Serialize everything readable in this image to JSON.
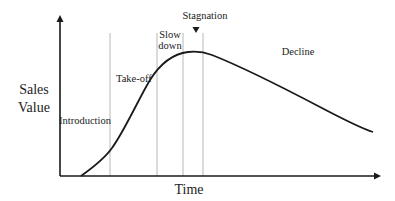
{
  "diagram": {
    "y_axis_label_line1": "Sales",
    "y_axis_label_line2": "Value",
    "x_axis_label": "Time",
    "stages": [
      {
        "label": "Introduction"
      },
      {
        "label": "Take-off"
      },
      {
        "label_line1": "Slow",
        "label_line2": "down"
      },
      {
        "label": "Stagnation",
        "marker": "down-arrow"
      },
      {
        "label": "Decline"
      }
    ],
    "colors": {
      "axis": "#1a1a1a",
      "curve": "#1a1a1a",
      "divider": "#b8b8b8",
      "text": "#222222",
      "background": "#ffffff"
    }
  }
}
